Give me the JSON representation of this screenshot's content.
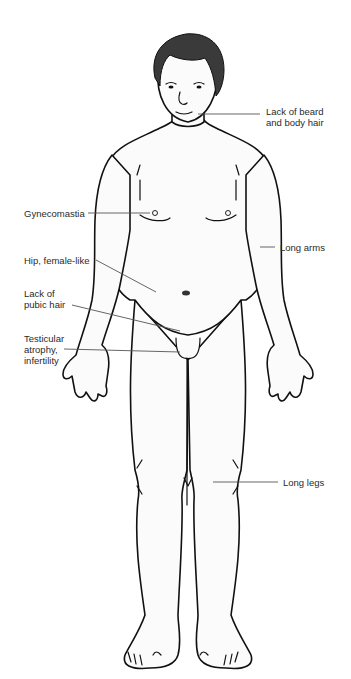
{
  "figure": {
    "colors": {
      "outline": "#111111",
      "skin": "#fbfbfb",
      "hair": "#3a3a3a",
      "leader": "#555555",
      "text": "#2a2a2a"
    }
  },
  "labels": {
    "beard": "Lack of beard\nand body hair",
    "gynecomastia": "Gynecomastia",
    "long_arms": "Long arms",
    "hip": "Hip, female-like",
    "pubic": "Lack of\npubic hair",
    "testicular": "Testicular\natrophy,\ninfertility",
    "long_legs": "Long legs"
  }
}
